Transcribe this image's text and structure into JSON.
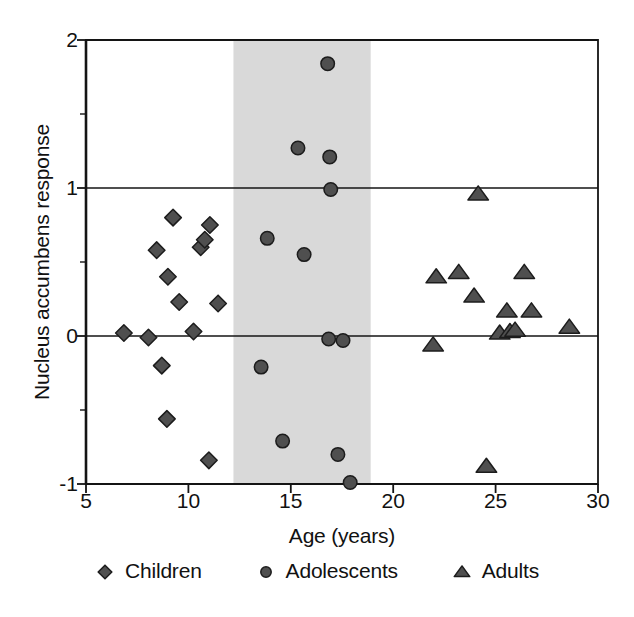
{
  "chart_data": {
    "type": "scatter",
    "title": "",
    "xlabel": "Age (years)",
    "ylabel": "Nucleus accumbens response",
    "xlim": [
      5,
      30
    ],
    "ylim": [
      -1,
      2
    ],
    "xticks": [
      5,
      10,
      15,
      20,
      25,
      30
    ],
    "yticks": [
      2,
      1,
      0,
      -1
    ],
    "ytick_labels": [
      "2",
      "1",
      "0",
      "-1"
    ],
    "xtick_labels": [
      "5",
      "10",
      "15",
      "20",
      "25",
      "30"
    ],
    "x_minor_tick_interval": 1,
    "y_minor_tick_interval": 0.5,
    "grid": false,
    "gridlines_y": [
      1,
      0
    ],
    "legend_position": "below-axes",
    "shaded_band": {
      "label": "adolescent age range",
      "x_start": 12.2,
      "x_end": 18.9,
      "color": "#d9d9d9"
    },
    "marker_colors": {
      "fill": "#4f4f4f",
      "edge": "#1c1c1c"
    },
    "series": [
      {
        "name": "Children",
        "marker": "diamond",
        "points": [
          [
            6.85,
            0.02
          ],
          [
            8.05,
            -0.01
          ],
          [
            8.45,
            0.58
          ],
          [
            8.7,
            -0.2
          ],
          [
            8.95,
            -0.56
          ],
          [
            9.0,
            0.4
          ],
          [
            9.25,
            0.8
          ],
          [
            9.55,
            0.23
          ],
          [
            10.25,
            0.03
          ],
          [
            10.6,
            0.6
          ],
          [
            10.8,
            0.65
          ],
          [
            11.0,
            -0.84
          ],
          [
            11.05,
            0.75
          ],
          [
            11.45,
            0.22
          ]
        ]
      },
      {
        "name": "Adolescents",
        "marker": "circle",
        "points": [
          [
            13.55,
            -0.21
          ],
          [
            13.85,
            0.66
          ],
          [
            14.6,
            -0.71
          ],
          [
            15.35,
            1.27
          ],
          [
            15.65,
            0.55
          ],
          [
            16.8,
            1.84
          ],
          [
            16.85,
            -0.02
          ],
          [
            16.9,
            1.21
          ],
          [
            16.95,
            0.99
          ],
          [
            17.3,
            -0.8
          ],
          [
            17.55,
            -0.03
          ],
          [
            17.9,
            -0.99
          ]
        ]
      },
      {
        "name": "Adults",
        "marker": "triangle",
        "points": [
          [
            21.95,
            -0.06
          ],
          [
            22.1,
            0.4
          ],
          [
            23.2,
            0.43
          ],
          [
            23.95,
            0.27
          ],
          [
            24.15,
            0.96
          ],
          [
            24.55,
            -0.88
          ],
          [
            25.2,
            0.02
          ],
          [
            25.55,
            0.17
          ],
          [
            25.7,
            0.03
          ],
          [
            25.95,
            0.04
          ],
          [
            26.4,
            0.43
          ],
          [
            26.75,
            0.17
          ],
          [
            28.6,
            0.06
          ]
        ]
      }
    ]
  },
  "legend": {
    "entries": [
      {
        "label": "Children",
        "marker": "diamond"
      },
      {
        "label": "Adolescents",
        "marker": "circle"
      },
      {
        "label": "Adults",
        "marker": "triangle"
      }
    ]
  }
}
